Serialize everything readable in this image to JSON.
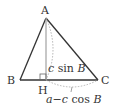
{
  "diagram": {
    "points": {
      "A": {
        "label": "A"
      },
      "B": {
        "label": "B"
      },
      "C": {
        "label": "C"
      },
      "H": {
        "label": "H"
      }
    },
    "annotations": {
      "height": {
        "var": "c",
        "fn": " sin ",
        "angle": "B"
      },
      "base_segment": {
        "a": "a",
        "minus": "−",
        "c": "c",
        "fn": " cos ",
        "angle": "B"
      }
    },
    "colors": {
      "line": "#333333",
      "altitude": "#999999",
      "dotted": "#aaaaaa"
    }
  }
}
